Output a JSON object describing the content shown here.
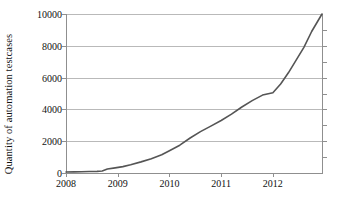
{
  "chart_data": {
    "type": "line",
    "title": "",
    "xlabel": "",
    "ylabel": "Quantity of automation testcases",
    "xlim": [
      2008,
      2012.95
    ],
    "ylim": [
      0,
      10000
    ],
    "grid": true,
    "legend": "none",
    "xticks": [
      2008,
      2009,
      2010,
      2011,
      2012
    ],
    "xtick_labels": [
      "2008",
      "2009",
      "2010",
      "2011",
      "2012"
    ],
    "yticks": [
      0,
      2000,
      4000,
      6000,
      8000,
      10000
    ],
    "ytick_labels": [
      "0",
      "2000",
      "4000",
      "6000",
      "8000",
      "10000"
    ],
    "series": [
      {
        "name": "Quantity of automation testcases",
        "color": "#555555",
        "x": [
          2008.0,
          2008.15,
          2008.3,
          2008.45,
          2008.6,
          2008.7,
          2008.8,
          2008.95,
          2009.1,
          2009.25,
          2009.45,
          2009.65,
          2009.85,
          2010.0,
          2010.2,
          2010.4,
          2010.6,
          2010.8,
          2011.0,
          2011.2,
          2011.4,
          2011.6,
          2011.8,
          2012.0,
          2012.15,
          2012.3,
          2012.45,
          2012.6,
          2012.75,
          2012.95
        ],
        "values": [
          60,
          70,
          80,
          90,
          100,
          130,
          250,
          320,
          400,
          520,
          700,
          900,
          1150,
          1400,
          1750,
          2200,
          2600,
          2950,
          3300,
          3700,
          4150,
          4550,
          4900,
          5050,
          5600,
          6300,
          7100,
          7900,
          8900,
          10000
        ]
      }
    ]
  },
  "axes": {
    "y_title": "Quantity of automation testcases"
  }
}
